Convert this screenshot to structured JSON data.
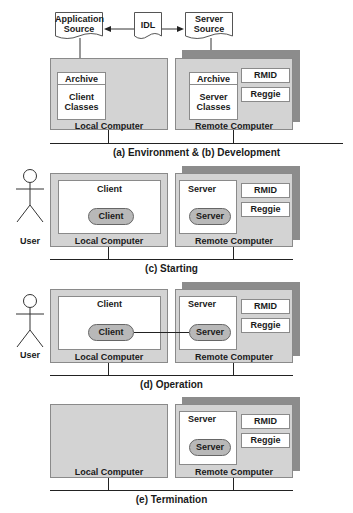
{
  "panel_ab": {
    "docs": {
      "app_source": "Application Source",
      "app_line1": "Application",
      "app_line2": "Source",
      "idl": "IDL",
      "server_line1": "Server",
      "server_line2": "Source"
    },
    "local": {
      "label": "Local Computer",
      "archive": "Archive",
      "classes_line1": "Client",
      "classes_line2": "Classes"
    },
    "remote": {
      "label": "Remote Computer",
      "archive": "Archive",
      "classes_line1": "Server",
      "classes_line2": "Classes",
      "rmid": "RMID",
      "reggie": "Reggie"
    },
    "caption": "(a) Environment & (b) Development"
  },
  "panel_c": {
    "user": "User",
    "local": {
      "label": "Local Computer",
      "box_title": "Client",
      "process": "Client"
    },
    "remote": {
      "label": "Remote Computer",
      "box_title": "Server",
      "process": "Server",
      "rmid": "RMID",
      "reggie": "Reggie"
    },
    "caption": "(c) Starting"
  },
  "panel_d": {
    "user": "User",
    "local": {
      "label": "Local Computer",
      "box_title": "Client",
      "process": "Client"
    },
    "remote": {
      "label": "Remote Computer",
      "box_title": "Server",
      "process": "Server",
      "rmid": "RMID",
      "reggie": "Reggie"
    },
    "caption": "(d) Operation"
  },
  "panel_e": {
    "local": {
      "label": "Local Computer"
    },
    "remote": {
      "label": "Remote Computer",
      "box_title": "Server",
      "process": "Server",
      "rmid": "RMID",
      "reggie": "Reggie"
    },
    "caption": "(e) Termination"
  }
}
